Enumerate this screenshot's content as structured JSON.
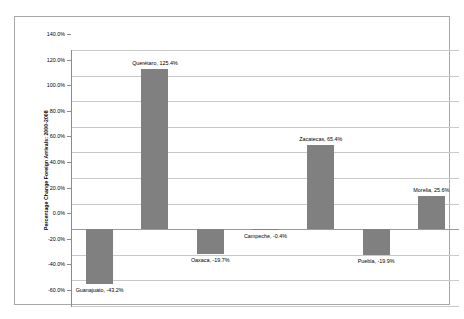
{
  "chart_data": {
    "type": "bar",
    "title": "",
    "subtitle": "",
    "xlabel": "",
    "ylabel": "Percentage Change Foreign Arrivals:  2000-2008",
    "ylim": [
      -60.0,
      140.0
    ],
    "ytick_step": 20.0,
    "ytick_labels": [
      "140.0%",
      "120.0%",
      "100.0%",
      "80.0%",
      "60.0%",
      "40.0%",
      "20.0%",
      "0.0%",
      "-20.0%",
      "-40.0%",
      "-60.0%"
    ],
    "ytick_values": [
      140.0,
      120.0,
      100.0,
      80.0,
      60.0,
      40.0,
      20.0,
      0.0,
      -20.0,
      -40.0,
      -60.0
    ],
    "grid": true,
    "legend": "none",
    "categories": [
      "Guanajuato",
      "Querétaro",
      "Oaxaca",
      "Campeche",
      "Zacatecas",
      "Puebla",
      "Morelia"
    ],
    "values": [
      -43.2,
      125.4,
      -19.7,
      -0.4,
      65.4,
      -19.9,
      25.6
    ],
    "point_labels": [
      "Guanajuato, -43.2%",
      "Querétaro, 125.4%",
      "Oaxaca, -19.7%",
      "Campeche, -0.4%",
      "Zacatecas, 65.4%",
      "Puebla, -19.9%",
      "Morelia, 25.6%"
    ],
    "bar_color": "#808080",
    "plot_background": "#ffffff",
    "gridline_color": "#c9c9c9",
    "axis_color": "#8c8c8c",
    "frame_color": "#a8a8a8"
  }
}
